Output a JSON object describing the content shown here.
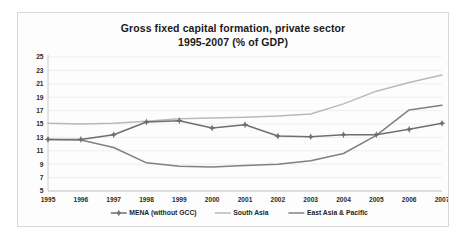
{
  "chart_data": {
    "type": "line",
    "title": "Gross fixed capital formation, private sector 1995-2007 (% of GDP)",
    "title_line1": "Gross fixed capital formation, private sector",
    "title_line2": "1995-2007 (% of GDP)",
    "xlabel": "",
    "ylabel": "",
    "grid": true,
    "legend_position": "bottom",
    "xlim": [
      1995,
      2007
    ],
    "ylim": [
      5,
      25
    ],
    "ytick_step": 2,
    "categories": [
      "1995",
      "1996",
      "1997",
      "1998",
      "1999",
      "2000",
      "2001",
      "2002",
      "2003",
      "2004",
      "2005",
      "2006",
      "2007"
    ],
    "yticks": [
      "5",
      "7",
      "9",
      "11",
      "13",
      "15",
      "17",
      "19",
      "21",
      "23",
      "25"
    ],
    "series": [
      {
        "name": "MENA (without GCC)",
        "color": "#6f6f6f",
        "width": 1.5,
        "marker": "diamond-plus",
        "values": [
          12.7,
          12.7,
          13.4,
          15.3,
          15.5,
          14.4,
          14.9,
          13.2,
          13.1,
          13.4,
          13.4,
          14.2,
          15.1
        ]
      },
      {
        "name": "South Asia",
        "color": "#b9b9b9",
        "width": 1.5,
        "marker": "none",
        "values": [
          15.1,
          15.0,
          15.1,
          15.4,
          15.8,
          15.9,
          16.0,
          16.2,
          16.5,
          18.0,
          19.9,
          21.2,
          22.3
        ]
      },
      {
        "name": "East Asia & Pacific",
        "color": "#808080",
        "width": 1.5,
        "marker": "none",
        "values": [
          12.7,
          12.6,
          11.5,
          9.2,
          8.7,
          8.6,
          8.8,
          9.0,
          9.5,
          10.6,
          13.3,
          17.1,
          17.8
        ]
      }
    ]
  }
}
